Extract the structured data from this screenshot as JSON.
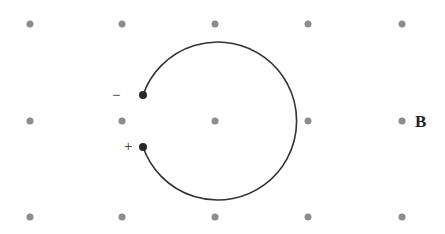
{
  "diagram": {
    "field_label": "B",
    "field_dot_color": "#8c8c8c",
    "grid": {
      "columns_x": [
        30,
        122,
        215,
        308,
        402
      ],
      "rows_y": [
        24,
        121,
        217
      ],
      "dot_radius": 3.5
    },
    "path": {
      "center": [
        215,
        121
      ],
      "radius": 79,
      "stroke": "#333333",
      "description": "circular arc from negative charge over top and right side to positive charge"
    },
    "charges": [
      {
        "sign": "−",
        "label_pos": [
          112,
          88
        ],
        "point": [
          143,
          95
        ]
      },
      {
        "sign": "+",
        "label_pos": [
          124,
          139
        ],
        "point": [
          143,
          147
        ]
      }
    ]
  }
}
